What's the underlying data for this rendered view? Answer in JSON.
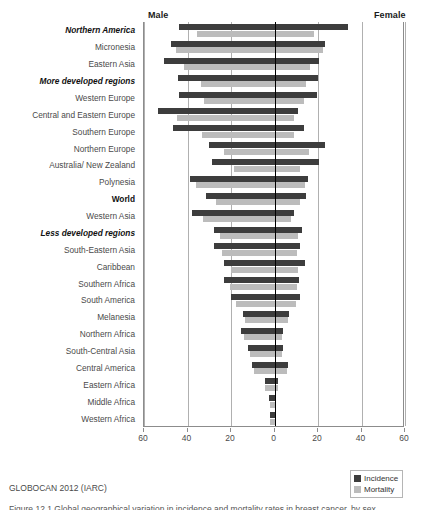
{
  "header": {
    "male_label": "Male",
    "female_label": "Female"
  },
  "source_note": "GLOBOCAN 2012 (IARC)",
  "caption_sliver": "Figure 12.1  Global geographical variation in incidence and mortality rates in breast cancer, by sex",
  "legend": {
    "position": "bottom-right",
    "entries": [
      {
        "label": "Incidence",
        "color": "#3d3d3d"
      },
      {
        "label": "Mortality",
        "color": "#bcbcbc"
      }
    ]
  },
  "chart_data": {
    "type": "bar",
    "subtype": "bilateral-tornado",
    "title": "",
    "subtitle": "",
    "xlabel": "",
    "ylabel": "",
    "xlim": [
      -60,
      60
    ],
    "xticks": [
      -60,
      -40,
      -20,
      0,
      20,
      40,
      60
    ],
    "xticklabels": [
      "60",
      "40",
      "20",
      "0",
      "20",
      "40",
      "60"
    ],
    "grid": true,
    "grid_axis": "x",
    "left_side": "Male",
    "right_side": "Female",
    "series": [
      {
        "name": "Incidence",
        "color": "#3d3d3d"
      },
      {
        "name": "Mortality",
        "color": "#bcbcbc"
      }
    ],
    "categories": [
      "Northern America",
      "Micronesia",
      "Eastern Asia",
      "More developed regions",
      "Western Europe",
      "Central and Eastern Europe",
      "Southern Europe",
      "Northern Europe",
      "Australia/ New Zealand",
      "Polynesia",
      "World",
      "Western Asia",
      "Less developed regions",
      "South-Eastern Asia",
      "Caribbean",
      "Southern Africa",
      "South America",
      "Melanesia",
      "Northern Africa",
      "South-Central Asia",
      "Central America",
      "Eastern Africa",
      "Middle Africa",
      "Western Africa"
    ],
    "emphasized_categories": [
      "More developed regions",
      "World",
      "Less developed regions"
    ],
    "rows": [
      {
        "category": "Northern America",
        "emphasis": "italic-bold",
        "male_incidence": 43.6,
        "female_incidence": 34.4,
        "male_mortality": 35.0,
        "female_mortality": 18.4
      },
      {
        "category": "Micronesia",
        "emphasis": "none",
        "male_incidence": 47.2,
        "female_incidence": 23.9,
        "male_mortality": 44.8,
        "female_mortality": 22.6
      },
      {
        "category": "Eastern Asia",
        "emphasis": "none",
        "male_incidence": 50.5,
        "female_incidence": 20.7,
        "male_mortality": 41.1,
        "female_mortality": 17.0
      },
      {
        "category": "More developed regions",
        "emphasis": "italic-bold",
        "male_incidence": 43.8,
        "female_incidence": 20.3,
        "male_mortality": 33.5,
        "female_mortality": 14.8
      },
      {
        "category": "Western Europe",
        "emphasis": "none",
        "male_incidence": 43.5,
        "female_incidence": 20.0,
        "male_mortality": 32.1,
        "female_mortality": 13.9
      },
      {
        "category": "Central and Eastern Europe",
        "emphasis": "none",
        "male_incidence": 53.1,
        "female_incidence": 11.1,
        "male_mortality": 44.2,
        "female_mortality": 9.4
      },
      {
        "category": "Southern Europe",
        "emphasis": "none",
        "male_incidence": 46.3,
        "female_incidence": 13.8,
        "male_mortality": 33.1,
        "female_mortality": 9.2
      },
      {
        "category": "Northern Europe",
        "emphasis": "none",
        "male_incidence": 29.8,
        "female_incidence": 23.8,
        "male_mortality": 22.6,
        "female_mortality": 16.3
      },
      {
        "category": "Australia/ New Zealand",
        "emphasis": "none",
        "male_incidence": 28.4,
        "female_incidence": 20.7,
        "male_mortality": 18.3,
        "female_mortality": 12.4
      },
      {
        "category": "Polynesia",
        "emphasis": "none",
        "male_incidence": 38.4,
        "female_incidence": 15.8,
        "male_mortality": 35.6,
        "female_mortality": 14.6
      },
      {
        "category": "World",
        "emphasis": "bold",
        "male_incidence": 31.1,
        "female_incidence": 14.8,
        "male_mortality": 26.6,
        "female_mortality": 12.2
      },
      {
        "category": "Western Asia",
        "emphasis": "none",
        "male_incidence": 37.5,
        "female_incidence": 9.3,
        "male_mortality": 32.6,
        "female_mortality": 8.1
      },
      {
        "category": "Less developed regions",
        "emphasis": "italic-bold",
        "male_incidence": 27.2,
        "female_incidence": 13.1,
        "male_mortality": 24.4,
        "female_mortality": 11.4
      },
      {
        "category": "South-Eastern Asia",
        "emphasis": "none",
        "male_incidence": 27.4,
        "female_incidence": 12.2,
        "male_mortality": 23.6,
        "female_mortality": 10.6
      },
      {
        "category": "Caribbean",
        "emphasis": "none",
        "male_incidence": 22.6,
        "female_incidence": 14.5,
        "male_mortality": 19.4,
        "female_mortality": 11.4
      },
      {
        "category": "Southern Africa",
        "emphasis": "none",
        "male_incidence": 22.7,
        "female_incidence": 11.8,
        "male_mortality": 20.0,
        "female_mortality": 10.6
      },
      {
        "category": "South America",
        "emphasis": "none",
        "male_incidence": 19.5,
        "female_incidence": 12.0,
        "male_mortality": 17.2,
        "female_mortality": 10.4
      },
      {
        "category": "Melanesia",
        "emphasis": "none",
        "male_incidence": 13.9,
        "female_incidence": 7.0,
        "male_mortality": 13.0,
        "female_mortality": 6.6
      },
      {
        "category": "Northern Africa",
        "emphasis": "none",
        "male_incidence": 15.0,
        "female_incidence": 4.4,
        "male_mortality": 13.6,
        "female_mortality": 4.0
      },
      {
        "category": "South-Central Asia",
        "emphasis": "none",
        "male_incidence": 11.7,
        "female_incidence": 4.5,
        "male_mortality": 10.6,
        "female_mortality": 4.0
      },
      {
        "category": "Central America",
        "emphasis": "none",
        "male_incidence": 10.0,
        "female_incidence": 6.7,
        "male_mortality": 9.0,
        "female_mortality": 6.0
      },
      {
        "category": "Eastern Africa",
        "emphasis": "none",
        "male_incidence": 4.1,
        "female_incidence": 2.1,
        "male_mortality": 3.7,
        "female_mortality": 1.9
      },
      {
        "category": "Middle Africa",
        "emphasis": "none",
        "male_incidence": 1.9,
        "female_incidence": 1.0,
        "male_mortality": 1.7,
        "female_mortality": 0.9
      },
      {
        "category": "Western Africa",
        "emphasis": "none",
        "male_incidence": 1.6,
        "female_incidence": 0.9,
        "male_mortality": 1.4,
        "female_mortality": 0.8
      }
    ]
  }
}
